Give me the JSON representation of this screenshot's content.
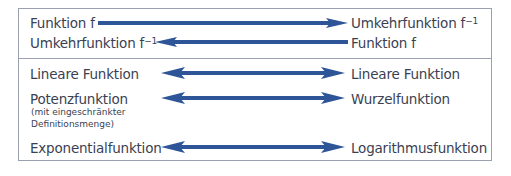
{
  "colors": {
    "arrow": "#2e5597",
    "border": "#9aa0b0",
    "text": "#3a3f52"
  },
  "top_section": {
    "rows": [
      {
        "left": "Funktion f",
        "left_sup": "",
        "right": "Umkehrfunktion f",
        "right_sup": "−1",
        "direction": "right"
      },
      {
        "left": "Umkehrfunktion f",
        "left_sup": "−1",
        "right": "Funktion f",
        "right_sup": "",
        "direction": "left"
      }
    ]
  },
  "bottom_section": {
    "rows": [
      {
        "left": "Lineare Funktion",
        "right": "Lineare Funktion",
        "direction": "both"
      },
      {
        "left": "Potenzfunktion",
        "left_note_1": "(mit eingeschränkter",
        "left_note_2": "Definitionsmenge)",
        "right": "Wurzelfunktion",
        "direction": "both"
      },
      {
        "left": "Exponentialfunktion",
        "right": "Logarithmusfunktion",
        "direction": "both"
      }
    ]
  }
}
